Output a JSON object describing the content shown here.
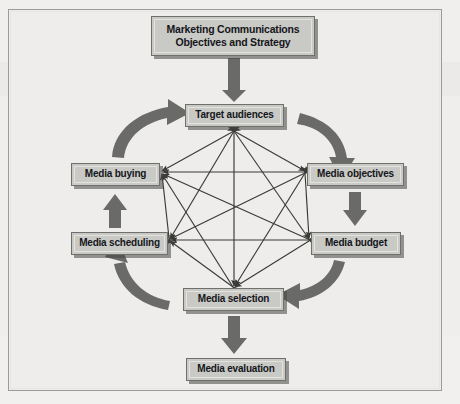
{
  "diagram": {
    "title_line1": "Marketing Communications",
    "title_line2": "Objectives and Strategy",
    "nodes": [
      {
        "id": "title",
        "label": "Marketing Communications Objectives and Strategy"
      },
      {
        "id": "target",
        "label": "Target audiences"
      },
      {
        "id": "objectives",
        "label": "Media objectives"
      },
      {
        "id": "budget",
        "label": "Media budget"
      },
      {
        "id": "selection",
        "label": "Media selection"
      },
      {
        "id": "scheduling",
        "label": "Media scheduling"
      },
      {
        "id": "buying",
        "label": "Media buying"
      },
      {
        "id": "evaluation",
        "label": "Media evaluation"
      }
    ],
    "flow_arrows": [
      {
        "from": "title",
        "to": "target",
        "style": "straight-down"
      },
      {
        "from": "target",
        "to": "objectives",
        "style": "curved-clockwise"
      },
      {
        "from": "objectives",
        "to": "budget",
        "style": "straight-down"
      },
      {
        "from": "budget",
        "to": "selection",
        "style": "curved-clockwise"
      },
      {
        "from": "selection",
        "to": "scheduling",
        "style": "curved-clockwise"
      },
      {
        "from": "scheduling",
        "to": "buying",
        "style": "straight-up"
      },
      {
        "from": "buying",
        "to": "target",
        "style": "curved-clockwise"
      },
      {
        "from": "selection",
        "to": "evaluation",
        "style": "straight-down"
      }
    ],
    "interconnections": {
      "description": "Every pair of the six cycle nodes is joined by a double-headed arrow",
      "double_headed": true,
      "pairs": [
        [
          "target",
          "objectives"
        ],
        [
          "target",
          "budget"
        ],
        [
          "target",
          "selection"
        ],
        [
          "target",
          "scheduling"
        ],
        [
          "target",
          "buying"
        ],
        [
          "objectives",
          "budget"
        ],
        [
          "objectives",
          "selection"
        ],
        [
          "objectives",
          "scheduling"
        ],
        [
          "objectives",
          "buying"
        ],
        [
          "budget",
          "selection"
        ],
        [
          "budget",
          "scheduling"
        ],
        [
          "budget",
          "buying"
        ],
        [
          "selection",
          "scheduling"
        ],
        [
          "selection",
          "buying"
        ],
        [
          "scheduling",
          "buying"
        ]
      ]
    },
    "colors": {
      "page_background": "#efeeec",
      "frame_border": "#9a9a98",
      "box_fill": "#c9c9c6",
      "box_border": "#6f6f6d",
      "box_text": "#15161a",
      "arrow": "#6a6a68",
      "line": "#3a3a38"
    }
  }
}
